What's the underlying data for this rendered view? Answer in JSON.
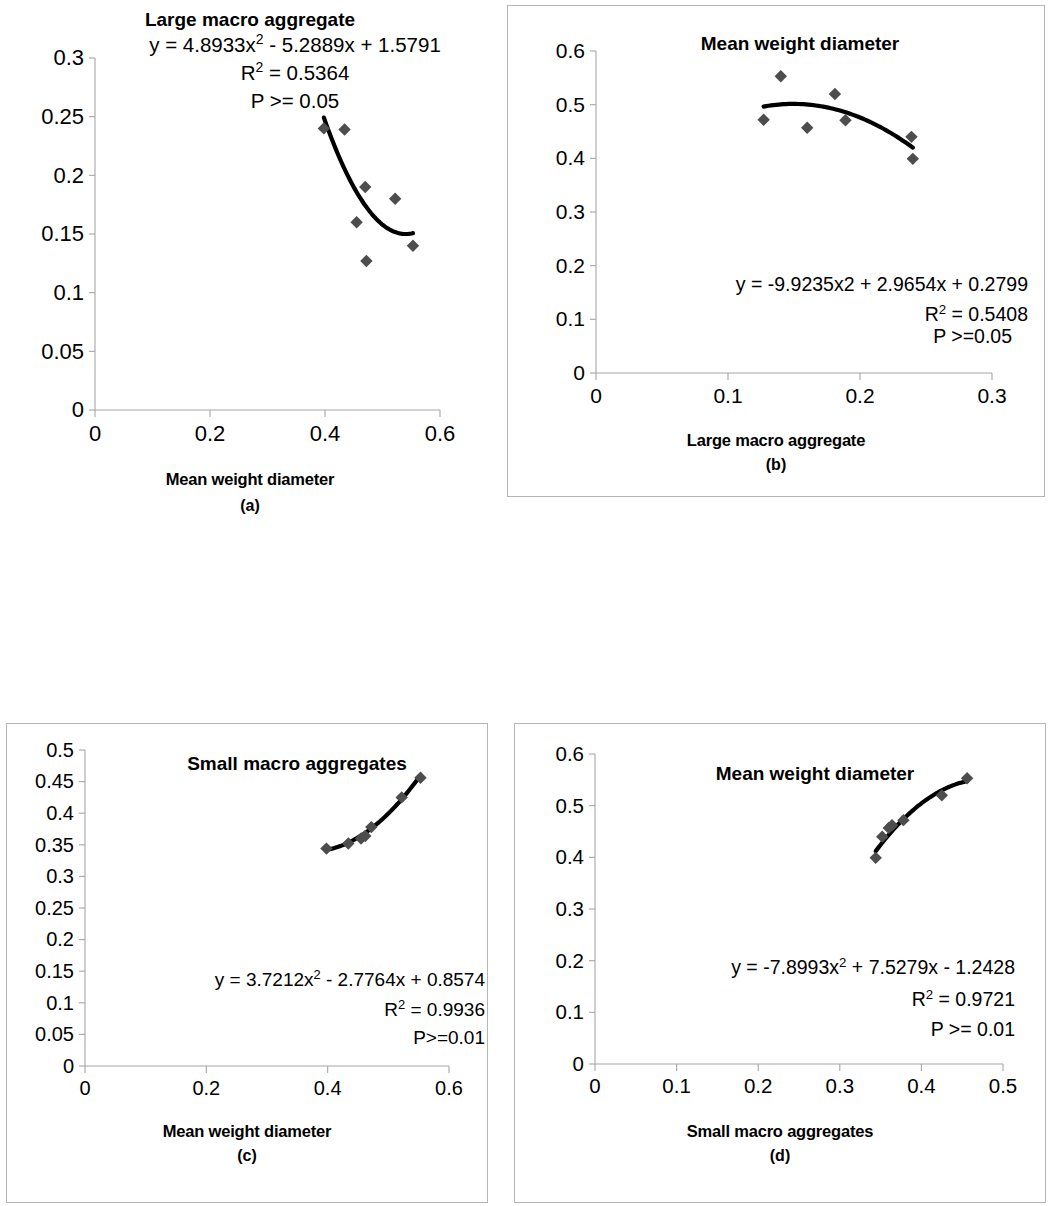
{
  "figure": {
    "panel_count": 4,
    "marker_color": "#4d4d4d",
    "trend_color": "#000000",
    "axis_color": "#a6a6a6",
    "frame_color": "#b5b5b5"
  },
  "panels": [
    {
      "id": "a",
      "letter": "(a)",
      "title": "Large macro aggregate",
      "xlabel": "Mean weight diameter",
      "ylabel": "Large macro aggregate",
      "framed": false,
      "eq_line1_pre": "y = 4.8933x",
      "eq_line1_sup": "2",
      "eq_line1_post": " - 5.2889x + 1.5791",
      "eq_r2_pre": "R",
      "eq_r2_sup": "2",
      "eq_r2_post": " = 0.5364",
      "eq_p": "P >= 0.05",
      "chart_data": {
        "type": "scatter",
        "title": "Large macro aggregate",
        "xlabel": "Mean weight diameter",
        "ylabel": "Large macro aggregate",
        "xlim": [
          0,
          0.6
        ],
        "ylim": [
          0,
          0.3
        ],
        "xticks": [
          "0",
          "0.2",
          "0.4",
          "0.6"
        ],
        "xtickvals": [
          0,
          0.2,
          0.4,
          0.6
        ],
        "yticks": [
          "0",
          "0.05",
          "0.1",
          "0.15",
          "0.2",
          "0.25",
          "0.3"
        ],
        "ytickvals": [
          0,
          0.05,
          0.1,
          0.15,
          0.2,
          0.25,
          0.3
        ],
        "grid": false,
        "legend": "none",
        "points": [
          {
            "x": 0.398,
            "y": 0.24
          },
          {
            "x": 0.434,
            "y": 0.239
          },
          {
            "x": 0.455,
            "y": 0.16
          },
          {
            "x": 0.47,
            "y": 0.19
          },
          {
            "x": 0.472,
            "y": 0.127
          },
          {
            "x": 0.522,
            "y": 0.18
          },
          {
            "x": 0.553,
            "y": 0.14
          }
        ],
        "fit": {
          "kind": "quadratic",
          "a": 4.8933,
          "b": -5.2889,
          "c": 1.5791,
          "equation": "y = 4.8933x2 - 5.2889x + 1.5791",
          "r_squared": 0.5364,
          "p_text": "P >= 0.05",
          "xrange": [
            0.398,
            0.553
          ]
        }
      }
    },
    {
      "id": "b",
      "letter": "(b)",
      "title": "Mean weight diameter",
      "xlabel": "Large macro aggregate",
      "ylabel": "Mean weight diameter",
      "framed": true,
      "eq_line1_pre": "y = -9.9235x2 + 2.9654x + 0.2799",
      "eq_line1_sup": "",
      "eq_line1_post": "",
      "eq_r2_pre": "R",
      "eq_r2_sup": "2",
      "eq_r2_post": " = 0.5408",
      "eq_p": "P >=0.05",
      "chart_data": {
        "type": "scatter",
        "title": "Mean weight diameter",
        "xlabel": "Large macro aggregate",
        "ylabel": "Mean weight diameter",
        "xlim": [
          0,
          0.3
        ],
        "ylim": [
          0,
          0.6
        ],
        "xticks": [
          "0",
          "0.1",
          "0.2",
          "0.3"
        ],
        "xtickvals": [
          0,
          0.1,
          0.2,
          0.3
        ],
        "yticks": [
          "0",
          "0.1",
          "0.2",
          "0.3",
          "0.4",
          "0.5",
          "0.6"
        ],
        "ytickvals": [
          0,
          0.1,
          0.2,
          0.3,
          0.4,
          0.5,
          0.6
        ],
        "grid": false,
        "legend": "none",
        "points": [
          {
            "x": 0.127,
            "y": 0.472
          },
          {
            "x": 0.14,
            "y": 0.553
          },
          {
            "x": 0.16,
            "y": 0.457
          },
          {
            "x": 0.181,
            "y": 0.52
          },
          {
            "x": 0.189,
            "y": 0.471
          },
          {
            "x": 0.239,
            "y": 0.44
          },
          {
            "x": 0.24,
            "y": 0.399
          }
        ],
        "fit": {
          "kind": "quadratic",
          "a": -9.9235,
          "b": 2.9654,
          "c": 0.2799,
          "equation": "y = -9.9235x2 + 2.9654x + 0.2799",
          "r_squared": 0.5408,
          "p_text": "P >=0.05",
          "xrange": [
            0.127,
            0.24
          ]
        }
      }
    },
    {
      "id": "c",
      "letter": "(c)",
      "title": "Small macro aggregates",
      "xlabel": "Mean weight diameter",
      "ylabel": "Small macro aggregates",
      "framed": true,
      "eq_line1_pre": "y = 3.7212x",
      "eq_line1_sup": "2",
      "eq_line1_post": " - 2.7764x + 0.8574",
      "eq_r2_pre": "R",
      "eq_r2_sup": "2",
      "eq_r2_post": " = 0.9936",
      "eq_p": "P>=0.01",
      "chart_data": {
        "type": "scatter",
        "title": "Small macro aggregates",
        "xlabel": "Mean weight diameter",
        "ylabel": "Small macro aggregates",
        "xlim": [
          0,
          0.6
        ],
        "ylim": [
          0,
          0.5
        ],
        "xticks": [
          "0",
          "0.2",
          "0.4",
          "0.6"
        ],
        "xtickvals": [
          0,
          0.2,
          0.4,
          0.6
        ],
        "yticks": [
          "0",
          "0.05",
          "0.1",
          "0.15",
          "0.2",
          "0.25",
          "0.3",
          "0.35",
          "0.4",
          "0.45",
          "0.5"
        ],
        "ytickvals": [
          0,
          0.05,
          0.1,
          0.15,
          0.2,
          0.25,
          0.3,
          0.35,
          0.4,
          0.45,
          0.5
        ],
        "grid": false,
        "legend": "none",
        "points": [
          {
            "x": 0.398,
            "y": 0.344
          },
          {
            "x": 0.434,
            "y": 0.352
          },
          {
            "x": 0.455,
            "y": 0.36
          },
          {
            "x": 0.462,
            "y": 0.364
          },
          {
            "x": 0.472,
            "y": 0.378
          },
          {
            "x": 0.522,
            "y": 0.425
          },
          {
            "x": 0.553,
            "y": 0.456
          }
        ],
        "fit": {
          "kind": "quadratic",
          "a": 3.7212,
          "b": -2.7764,
          "c": 0.8574,
          "equation": "y = 3.7212x2 - 2.7764x + 0.8574",
          "r_squared": 0.9936,
          "p_text": "P>=0.01",
          "xrange": [
            0.398,
            0.553
          ]
        }
      }
    },
    {
      "id": "d",
      "letter": "(d)",
      "title": "Mean weight diameter",
      "xlabel": "Small macro aggregates",
      "ylabel": "Mean weight diameter",
      "framed": true,
      "eq_line1_pre": "y = -7.8993x",
      "eq_line1_sup": "2",
      "eq_line1_post": " + 7.5279x - 1.2428",
      "eq_r2_pre": "R",
      "eq_r2_sup": "2",
      "eq_r2_post": " = 0.9721",
      "eq_p": "P >= 0.01",
      "chart_data": {
        "type": "scatter",
        "title": "Mean weight diameter",
        "xlabel": "Small macro aggregates",
        "ylabel": "Mean weight diameter",
        "xlim": [
          0,
          0.5
        ],
        "ylim": [
          0,
          0.6
        ],
        "xticks": [
          "0",
          "0.1",
          "0.2",
          "0.3",
          "0.4",
          "0.5"
        ],
        "xtickvals": [
          0,
          0.1,
          0.2,
          0.3,
          0.4,
          0.5
        ],
        "yticks": [
          "0",
          "0.1",
          "0.2",
          "0.3",
          "0.4",
          "0.5",
          "0.6"
        ],
        "ytickvals": [
          0,
          0.1,
          0.2,
          0.3,
          0.4,
          0.5,
          0.6
        ],
        "grid": false,
        "legend": "none",
        "points": [
          {
            "x": 0.344,
            "y": 0.399
          },
          {
            "x": 0.352,
            "y": 0.44
          },
          {
            "x": 0.36,
            "y": 0.457
          },
          {
            "x": 0.364,
            "y": 0.462
          },
          {
            "x": 0.378,
            "y": 0.472
          },
          {
            "x": 0.425,
            "y": 0.52
          },
          {
            "x": 0.456,
            "y": 0.553
          }
        ],
        "fit": {
          "kind": "quadratic",
          "a": -7.8993,
          "b": 7.5279,
          "c": -1.2428,
          "equation": "y = -7.8993x2 + 7.5279x - 1.2428",
          "r_squared": 0.9721,
          "p_text": "P >= 0.01",
          "xrange": [
            0.344,
            0.456
          ]
        }
      }
    }
  ]
}
